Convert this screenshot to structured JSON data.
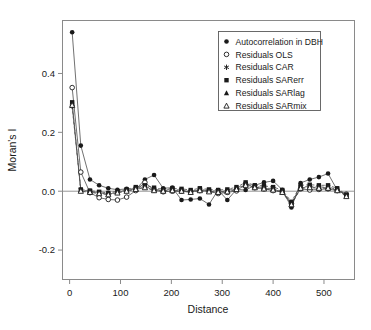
{
  "chart_data": {
    "type": "line",
    "title": "",
    "xlabel": "Distance",
    "ylabel": "Moran's I",
    "xlim": [
      -14,
      560
    ],
    "ylim": [
      -0.3,
      0.58
    ],
    "xticks": [
      0,
      100,
      200,
      300,
      400,
      500
    ],
    "xtick_labels": [
      "0",
      "100",
      "200",
      "300",
      "400",
      "500"
    ],
    "yticks": [
      -0.2,
      0.0,
      0.2,
      0.4
    ],
    "ytick_labels": [
      "-0.2",
      "0.0",
      "0.2",
      "0.4"
    ],
    "grid": false,
    "zero_line": true,
    "legend_position": "top-right",
    "x": [
      5,
      22,
      40,
      58,
      76,
      94,
      112,
      130,
      148,
      166,
      184,
      202,
      220,
      238,
      256,
      274,
      292,
      310,
      328,
      346,
      364,
      382,
      400,
      418,
      436,
      454,
      472,
      490,
      508,
      526,
      544
    ],
    "series": [
      {
        "name": "Autocorrelation in DBH",
        "marker": "filled-circle",
        "line": "solid",
        "values": [
          0.54,
          0.155,
          0.04,
          0.02,
          0.01,
          0.005,
          0.008,
          0.006,
          0.04,
          0.055,
          0.01,
          0.012,
          -0.03,
          -0.028,
          -0.025,
          -0.045,
          0.004,
          -0.03,
          0.006,
          0.004,
          0.02,
          0.03,
          0.035,
          0.005,
          -0.055,
          0.028,
          0.04,
          0.048,
          0.06,
          0.004,
          -0.012
        ]
      },
      {
        "name": "Residuals OLS",
        "marker": "open-circle",
        "line": "solid",
        "values": [
          0.352,
          0.065,
          -0.005,
          -0.022,
          -0.028,
          -0.03,
          -0.02,
          0.002,
          0.03,
          0.004,
          -0.002,
          0.0,
          0.0,
          -0.002,
          0.002,
          0.0,
          -0.008,
          -0.004,
          0.001,
          0.024,
          0.012,
          0.008,
          0.002,
          -0.002,
          -0.042,
          0.008,
          0.004,
          0.006,
          0.008,
          0.002,
          -0.01
        ]
      },
      {
        "name": "Residuals CAR",
        "marker": "asterisk",
        "line": "dashed",
        "values": [
          0.288,
          0.004,
          0.0,
          -0.005,
          -0.01,
          -0.004,
          0.004,
          0.01,
          0.016,
          0.006,
          0.004,
          0.006,
          0.004,
          0.0,
          0.006,
          0.002,
          0.0,
          0.002,
          0.01,
          0.026,
          0.016,
          0.012,
          0.008,
          0.0,
          -0.04,
          0.014,
          0.016,
          0.014,
          0.014,
          0.006,
          -0.014
        ]
      },
      {
        "name": "Residuals SARerr",
        "marker": "filled-square",
        "line": "dashed",
        "values": [
          0.302,
          0.006,
          0.002,
          -0.002,
          -0.006,
          0.0,
          0.006,
          0.014,
          0.02,
          0.012,
          0.006,
          0.01,
          0.008,
          0.004,
          0.01,
          0.006,
          0.004,
          0.006,
          0.014,
          0.03,
          0.02,
          0.018,
          0.014,
          0.004,
          -0.036,
          0.02,
          0.022,
          0.02,
          0.02,
          0.01,
          -0.012
        ]
      },
      {
        "name": "Residuals SARlag",
        "marker": "filled-triangle",
        "line": "dashed",
        "values": [
          0.296,
          0.002,
          -0.002,
          -0.006,
          -0.01,
          -0.004,
          0.002,
          0.008,
          0.014,
          0.004,
          0.002,
          0.004,
          0.002,
          -0.002,
          0.004,
          0.0,
          -0.002,
          0.0,
          0.008,
          0.022,
          0.014,
          0.01,
          0.006,
          -0.002,
          -0.044,
          0.012,
          0.014,
          0.012,
          0.012,
          0.004,
          -0.016
        ]
      },
      {
        "name": "Residuals SARmix",
        "marker": "open-triangle",
        "line": "dashed",
        "values": [
          0.292,
          0.0,
          -0.004,
          -0.008,
          -0.012,
          -0.006,
          0.0,
          0.006,
          0.012,
          0.002,
          0.0,
          0.002,
          0.0,
          -0.004,
          0.002,
          -0.002,
          -0.004,
          -0.002,
          0.006,
          0.02,
          0.012,
          0.008,
          0.004,
          -0.004,
          -0.046,
          0.01,
          0.012,
          0.01,
          0.01,
          0.002,
          -0.018
        ]
      }
    ]
  },
  "legend": {
    "items": [
      {
        "label": "Autocorrelation in DBH",
        "marker": "filled-circle"
      },
      {
        "label": "Residuals OLS",
        "marker": "open-circle"
      },
      {
        "label": "Residuals CAR",
        "marker": "asterisk"
      },
      {
        "label": "Residuals SARerr",
        "marker": "filled-square"
      },
      {
        "label": "Residuals SARlag",
        "marker": "filled-triangle"
      },
      {
        "label": "Residuals SARmix",
        "marker": "open-triangle"
      }
    ]
  },
  "colors": {
    "ink": "#1a1a1a",
    "frame": "#8a8a8a",
    "line": "#4d4d4d",
    "background": "#ffffff"
  }
}
